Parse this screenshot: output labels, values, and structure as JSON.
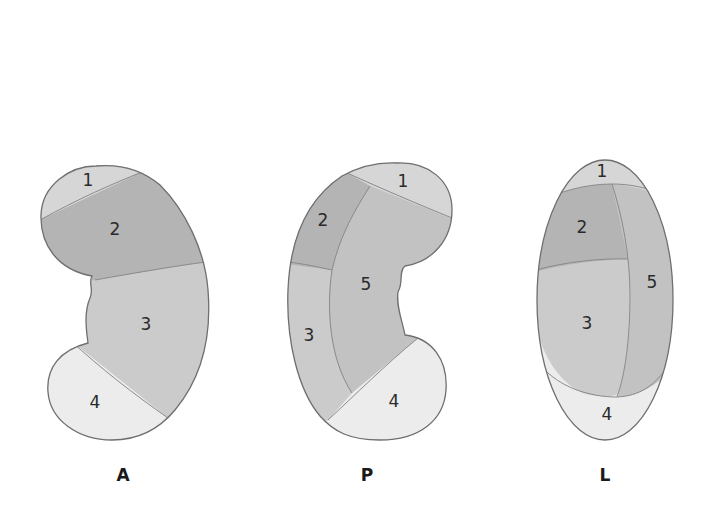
{
  "figure": {
    "colors": {
      "segment_1": "#d6d6d6",
      "segment_2": "#b4b4b4",
      "segment_3": "#cbcbcb",
      "segment_4": "#ececec",
      "segment_5": "#c2c2c2",
      "outline": "#6f6f6f",
      "background": "#ffffff"
    },
    "views": [
      {
        "id": "A",
        "label": "A",
        "segments": [
          {
            "number": "1"
          },
          {
            "number": "2"
          },
          {
            "number": "3"
          },
          {
            "number": "4"
          }
        ]
      },
      {
        "id": "P",
        "label": "P",
        "segments": [
          {
            "number": "1"
          },
          {
            "number": "2"
          },
          {
            "number": "5"
          },
          {
            "number": "3"
          },
          {
            "number": "4"
          }
        ]
      },
      {
        "id": "L",
        "label": "L",
        "segments": [
          {
            "number": "1"
          },
          {
            "number": "2"
          },
          {
            "number": "5"
          },
          {
            "number": "3"
          },
          {
            "number": "4"
          }
        ]
      }
    ]
  }
}
